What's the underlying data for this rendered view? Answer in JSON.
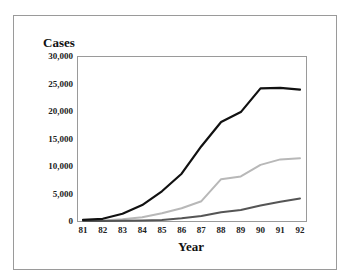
{
  "chart_data": {
    "type": "line",
    "title": "",
    "ylabel": "Cases",
    "xlabel": "Year",
    "categories": [
      "81",
      "82",
      "83",
      "84",
      "85",
      "86",
      "87",
      "88",
      "89",
      "90",
      "91",
      "92"
    ],
    "ylim": [
      0,
      30000
    ],
    "yticks": [
      "0",
      "5,000",
      "10,000",
      "15,000",
      "20,000",
      "25,000",
      "30,000"
    ],
    "ytick_values": [
      0,
      5000,
      10000,
      15000,
      20000,
      25000,
      30000
    ],
    "grid": false,
    "legend": null,
    "series": [
      {
        "name": "Series 1 (black)",
        "color": "#111111",
        "values": [
          200,
          400,
          1300,
          2900,
          5400,
          8600,
          13600,
          18000,
          19800,
          24100,
          24200,
          23900
        ]
      },
      {
        "name": "Series 2 (light gray)",
        "color": "#b8b8b8",
        "values": [
          0,
          100,
          300,
          700,
          1400,
          2300,
          3600,
          7600,
          8100,
          10200,
          11200,
          11400
        ]
      },
      {
        "name": "Series 3 (dark gray)",
        "color": "#555555",
        "values": [
          0,
          0,
          50,
          100,
          200,
          500,
          900,
          1600,
          2000,
          2800,
          3500,
          4100
        ]
      }
    ]
  },
  "layout": {
    "plot": {
      "left": 77,
      "right": 306,
      "top": 56,
      "bottom": 221
    },
    "x_first": 83,
    "x_last": 300
  }
}
